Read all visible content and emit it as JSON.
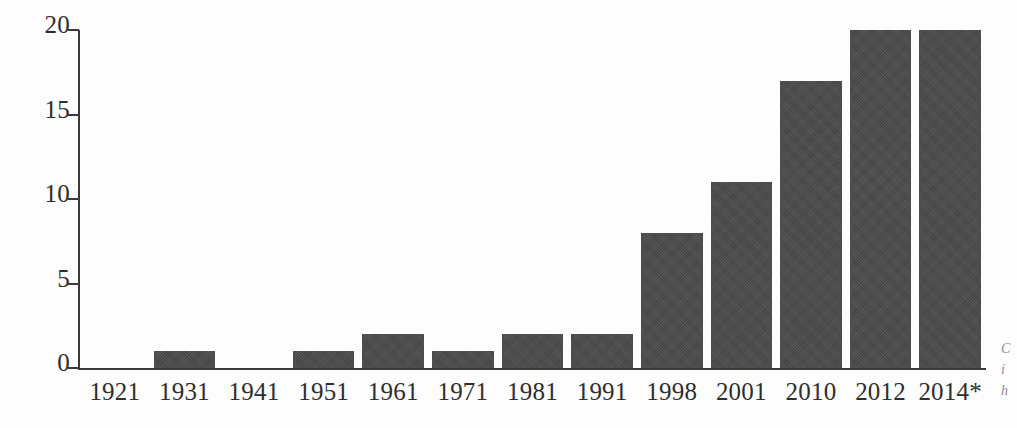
{
  "chart_data": {
    "type": "bar",
    "title": "",
    "subtitle": "",
    "xlabel": "",
    "ylabel": "",
    "categories": [
      "1921",
      "1931",
      "1941",
      "1951",
      "1961",
      "1971",
      "1981",
      "1991",
      "1998",
      "2001",
      "2010",
      "2012",
      "2014*"
    ],
    "values": [
      0,
      1,
      0,
      1,
      2,
      1,
      2,
      2,
      8,
      11,
      17,
      20,
      20
    ],
    "ylim": [
      0,
      20
    ],
    "y_ticks": [
      "0",
      "5",
      "10",
      "15",
      "20"
    ],
    "y_tick_values": [
      0,
      5,
      10,
      15,
      20
    ],
    "grid": false,
    "legend": null,
    "bar_color": "#4a4a4a",
    "axis_color": "#3a3a3a",
    "background_color": "#fdfdfd",
    "annotations": [
      "2014*"
    ]
  },
  "margin_caption": {
    "line1": "C",
    "line2": "i",
    "line3": "h"
  }
}
